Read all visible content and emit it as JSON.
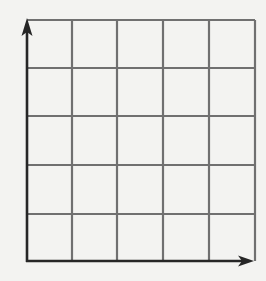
{
  "diagram": {
    "type": "coordinate-grid",
    "rows": 5,
    "columns": 5,
    "axes": {
      "x": {
        "arrow": true,
        "direction": "right",
        "label": ""
      },
      "y": {
        "arrow": true,
        "direction": "up",
        "label": ""
      }
    },
    "grid": {
      "x_lines": [
        27,
        72,
        117,
        163,
        209,
        255
      ],
      "y_lines": [
        20,
        68,
        116,
        165,
        214,
        261
      ]
    },
    "colors": {
      "background": "#f3f3f1",
      "grid_line": "#707070",
      "axis": "#262626"
    }
  }
}
